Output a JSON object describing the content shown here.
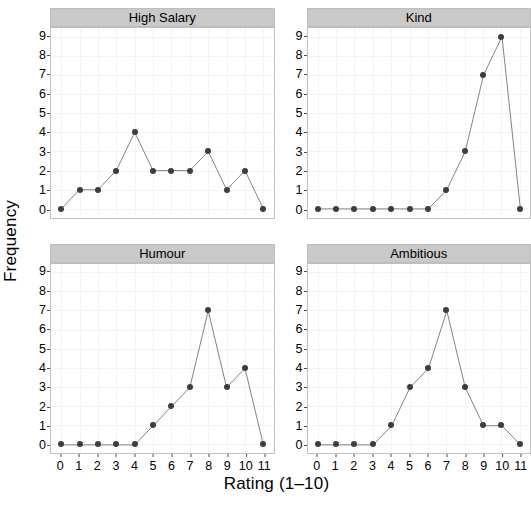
{
  "chart_data": {
    "type": "line",
    "title": "",
    "xlabel": "Rating (1–10)",
    "ylabel": "Frequency",
    "x": [
      0,
      1,
      2,
      3,
      4,
      5,
      6,
      7,
      8,
      9,
      10,
      11
    ],
    "xticklabels": [
      "0",
      "1",
      "2",
      "3",
      "4",
      "5",
      "6",
      "7",
      "8",
      "9",
      "10",
      "11"
    ],
    "yticklabels": [
      "0",
      "1",
      "2",
      "3",
      "4",
      "5",
      "6",
      "7",
      "8",
      "9"
    ],
    "xlim": [
      -0.55,
      11.55
    ],
    "ylim": [
      -0.45,
      9.45
    ],
    "grid": true,
    "legend": false,
    "marker": "filled-circle",
    "line_color": "#4d4d4d",
    "marker_color": "#3d3d3d",
    "panels": [
      {
        "name": "High Salary",
        "values": [
          0,
          1,
          1,
          2,
          4,
          2,
          2,
          2,
          3,
          1,
          2,
          0
        ],
        "show_xticklabels": false
      },
      {
        "name": "Kind",
        "values": [
          0,
          0,
          0,
          0,
          0,
          0,
          0,
          1,
          3,
          7,
          9,
          0
        ],
        "show_xticklabels": false
      },
      {
        "name": "Humour",
        "values": [
          0,
          0,
          0,
          0,
          0,
          1,
          2,
          3,
          7,
          3,
          4,
          0
        ],
        "show_xticklabels": true
      },
      {
        "name": "Ambitious",
        "values": [
          0,
          0,
          0,
          0,
          1,
          3,
          4,
          7,
          3,
          1,
          1,
          0
        ],
        "show_xticklabels": true
      }
    ]
  },
  "caption": ""
}
